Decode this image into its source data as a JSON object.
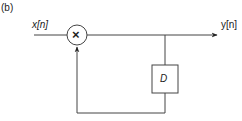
{
  "figure": {
    "panel_label": "(b)",
    "input_label": "x[n]",
    "output_label": "y[n]",
    "multiplier_symbol": "×",
    "delay_label": "D"
  },
  "colors": {
    "line": "#333333",
    "background": "#ffffff"
  }
}
